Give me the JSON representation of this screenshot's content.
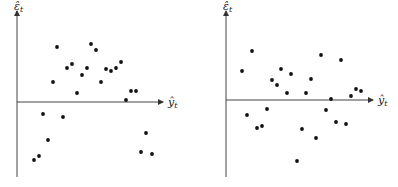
{
  "chart_data": [
    {
      "type": "scatter",
      "title": "",
      "xlabel": "ŷ_t",
      "ylabel": "ε̂_t",
      "grid": false,
      "legend": null,
      "axes": {
        "origin_px": [
          17,
          102
        ],
        "x_end_px": 163,
        "y_top_px": 9,
        "y_bottom_px": 177
      },
      "points_px": [
        [
          57,
          47
        ],
        [
          91,
          44
        ],
        [
          96,
          50
        ],
        [
          67,
          68
        ],
        [
          72,
          64
        ],
        [
          87,
          68
        ],
        [
          82,
          75
        ],
        [
          53,
          82
        ],
        [
          77,
          93
        ],
        [
          101,
          82
        ],
        [
          106,
          69
        ],
        [
          111,
          71
        ],
        [
          116,
          68
        ],
        [
          121,
          62
        ],
        [
          131,
          91
        ],
        [
          136,
          91
        ],
        [
          126,
          100
        ],
        [
          43,
          114
        ],
        [
          63,
          117
        ],
        [
          48,
          140
        ],
        [
          39,
          156
        ],
        [
          34,
          160
        ],
        [
          146,
          133
        ],
        [
          141,
          152
        ],
        [
          152,
          154
        ]
      ],
      "description": "Residuals vs fitted values showing curved (nonlinear) pattern"
    },
    {
      "type": "scatter",
      "title": "",
      "xlabel": "ŷ_t",
      "ylabel": "ε̂_t",
      "grid": false,
      "legend": null,
      "axes": {
        "origin_px": [
          226,
          100
        ],
        "x_end_px": 373,
        "y_top_px": 9,
        "y_bottom_px": 177
      },
      "points_px": [
        [
          252,
          51
        ],
        [
          242,
          71
        ],
        [
          281,
          69
        ],
        [
          291,
          74
        ],
        [
          272,
          80
        ],
        [
          277,
          85
        ],
        [
          287,
          93
        ],
        [
          321,
          55
        ],
        [
          341,
          60
        ],
        [
          311,
          79
        ],
        [
          306,
          93
        ],
        [
          331,
          99
        ],
        [
          351,
          96
        ],
        [
          356,
          89
        ],
        [
          361,
          91
        ],
        [
          247,
          115
        ],
        [
          267,
          109
        ],
        [
          257,
          128
        ],
        [
          262,
          126
        ],
        [
          302,
          129
        ],
        [
          326,
          110
        ],
        [
          336,
          122
        ],
        [
          346,
          124
        ],
        [
          316,
          138
        ],
        [
          297,
          161
        ]
      ],
      "description": "Residuals vs fitted values showing random scatter (no pattern)"
    }
  ],
  "labels": {
    "y_main": "ε̂",
    "y_sub": "t",
    "x_main": "ŷ",
    "x_sub": "t"
  }
}
